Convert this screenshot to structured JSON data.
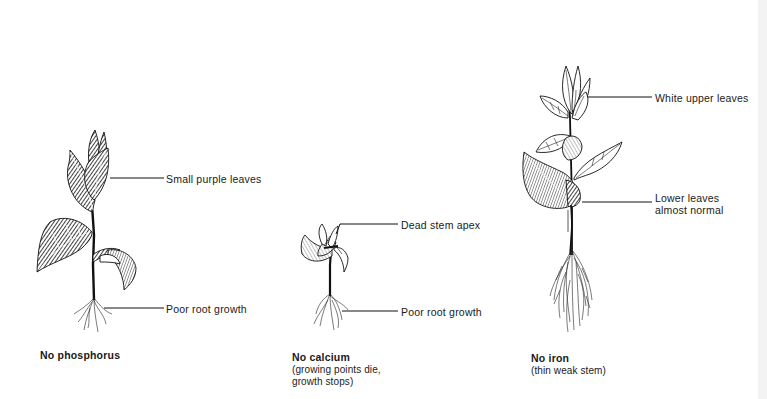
{
  "diagram": {
    "colors": {
      "ink": "#111111",
      "background": "#ffffff"
    },
    "plants": [
      {
        "id": "phosphorus",
        "title": "No phosphorus",
        "subtitle": "",
        "labels": [
          "Small purple leaves",
          "Poor root growth"
        ]
      },
      {
        "id": "calcium",
        "title": "No calcium",
        "subtitle": "(growing points die,\ngrowth stops)",
        "labels": [
          "Dead stem apex",
          "Poor root growth"
        ]
      },
      {
        "id": "iron",
        "title": "No iron",
        "subtitle": "(thin weak stem)",
        "labels": [
          "White upper leaves",
          "Lower leaves\nalmost normal"
        ]
      }
    ]
  }
}
